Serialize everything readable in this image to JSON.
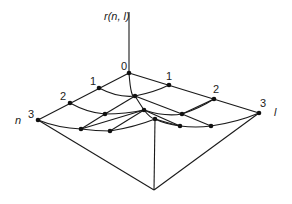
{
  "diagram": {
    "type": "3d-lattice-surface",
    "vertical_axis_label": "r(n, l)",
    "n_axis_label": "n",
    "l_axis_label": "l",
    "n_ticks": [
      "0",
      "1",
      "2",
      "3"
    ],
    "l_ticks": [
      "1",
      "2",
      "3"
    ],
    "line_color": "#1a1a1a",
    "background": "#ffffff"
  }
}
